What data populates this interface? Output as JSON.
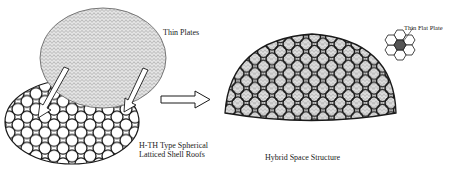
{
  "figure": {
    "labels": {
      "thin_plates": "Thin Plates",
      "htth_line1": "H-TH Type Spherical",
      "htth_line2": "Latticed Shell Roofs",
      "hybrid": "Hybrid Space Structure",
      "thin_flat_plate": "Thin Flat Plate"
    },
    "elements": {
      "top_dome": "fine triangulated thin-plate dome",
      "bottom_lattice": "hexagon-triangle latticed shell disc",
      "assembly_arrows": 2,
      "transform_arrow": "hollow right arrow",
      "result_dome": "hybrid dome with hexagonal ribs",
      "detail_inset": "7-hexagon cluster, center shaded"
    },
    "colors": {
      "stroke": "#1a1a1a",
      "mesh": "#8a8a8a",
      "shade": "#555555",
      "background": "#ffffff"
    }
  }
}
